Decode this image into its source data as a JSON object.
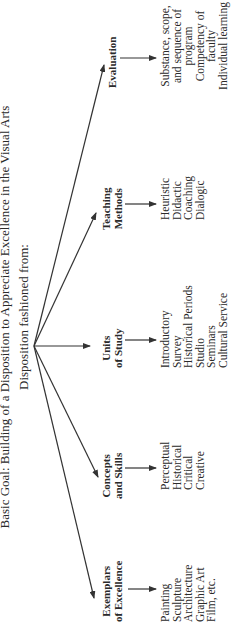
{
  "diagram": {
    "title": "Basic Goal: Building of a Disposition to Appreciate Excellence in the Visual Arts",
    "subtitle": "Disposition fashioned from:",
    "orientation": "rotated 90 degrees counter-clockwise",
    "hub": {
      "label": "Disposition fashioned from:"
    },
    "branches": [
      {
        "label_lines": [
          "Exemplars",
          "of Excellence"
        ],
        "items": [
          "Painting",
          "Sculpture",
          "Architecture",
          "Graphic Art",
          "Film, etc."
        ]
      },
      {
        "label_lines": [
          "Concepts",
          "and Skills"
        ],
        "items": [
          "Perceptual",
          "Historical",
          "Critical",
          "Creative"
        ]
      },
      {
        "label_lines": [
          "Units",
          "of Study"
        ],
        "items": [
          "Introductory",
          "Survey",
          "Historical Periods",
          "Studio",
          "Seminars",
          "Cultural Service"
        ]
      },
      {
        "label_lines": [
          "Teaching",
          "Methods"
        ],
        "items": [
          "Heuristic",
          "Didactic",
          "Coaching",
          "Dialogic"
        ]
      },
      {
        "label_lines": [
          "Evaluation"
        ],
        "items": [
          "Substance, scope,",
          "and sequence of",
          "program",
          "Competency of",
          "faculty",
          "Individual learning"
        ]
      }
    ],
    "colors": {
      "line": "#333333",
      "text": "#2a2a2a",
      "background": "#ffffff"
    }
  }
}
